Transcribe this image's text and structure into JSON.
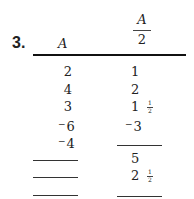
{
  "problem_number": "3.",
  "headers": {
    "col_a": "A",
    "col_b": {
      "numerator": "A",
      "denominator": "2"
    }
  },
  "rows": [
    {
      "a": {
        "sign": "",
        "value": "2"
      },
      "b": {
        "sign": "",
        "value": "1",
        "fraction": ""
      }
    },
    {
      "a": {
        "sign": "",
        "value": "4"
      },
      "b": {
        "sign": "",
        "value": "2",
        "fraction": ""
      }
    },
    {
      "a": {
        "sign": "",
        "value": "3"
      },
      "b": {
        "sign": "",
        "value": "1",
        "fraction": "1/2"
      }
    },
    {
      "a": {
        "sign": "−",
        "value": "6"
      },
      "b": {
        "sign": "−",
        "value": "3",
        "fraction": ""
      }
    },
    {
      "a": {
        "sign": "−",
        "value": "4"
      },
      "b": {
        "blank": true
      }
    },
    {
      "a": {
        "blank": true
      },
      "b": {
        "sign": "",
        "value": "5",
        "fraction": ""
      }
    },
    {
      "a": {
        "blank": true
      },
      "b": {
        "sign": "",
        "value": "2",
        "fraction": "1/2"
      }
    },
    {
      "a": {
        "blank": true
      },
      "b": {
        "blank": true
      }
    }
  ],
  "half": {
    "num": "1",
    "den": "2"
  },
  "neg_sign": "−"
}
